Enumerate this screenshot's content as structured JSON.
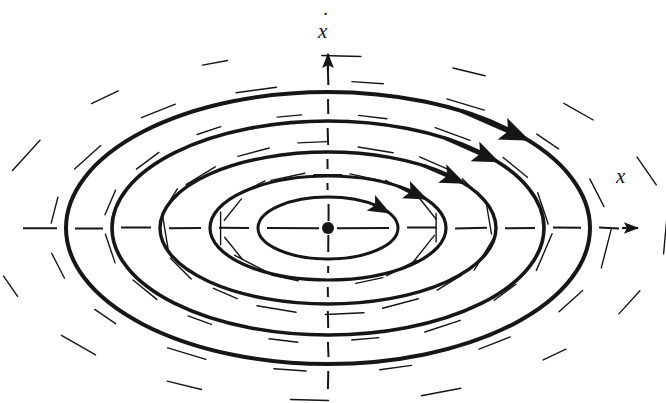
{
  "figure": {
    "kind": "phase-portrait",
    "caption_visible": false,
    "background_color": "#ffffff",
    "ink_color": "#161616",
    "axes": {
      "x_label": "x",
      "y_label": "ẋ",
      "y_label_base": "x",
      "y_label_dot": "˙",
      "x_axis_name": "horizontal-axis",
      "y_axis_name": "vertical-axis",
      "x_arrow_direction": "right",
      "y_arrow_direction": "up",
      "origin_px": [
        328,
        228
      ],
      "x_axis_extent_px": [
        14,
        640
      ],
      "y_axis_extent_px": [
        56,
        396
      ],
      "style": "dashed-segmented"
    },
    "equilibrium": {
      "type": "center",
      "marker": "filled-dot",
      "position_px": [
        328,
        228
      ],
      "radius_px": 6
    },
    "flow_direction": "clockwise",
    "arrow_count": 5,
    "trajectory_count": 5
  },
  "chart_data": {
    "type": "scatter",
    "title": "",
    "subtitle": "",
    "xlabel": "x",
    "ylabel": "ẋ",
    "grid": false,
    "legend": "none",
    "xlim": [
      -314,
      312
    ],
    "ylim": [
      -172,
      172
    ],
    "center_px": [
      328,
      228
    ],
    "orbits": [
      {
        "name": "orbit-1-inner",
        "semi_axis_x": 70,
        "semi_axis_y": 31,
        "stroke_width": 3.0,
        "arrow_angle_deg": 40
      },
      {
        "name": "orbit-2",
        "semi_axis_x": 118,
        "semi_axis_y": 52,
        "stroke_width": 3.2,
        "arrow_angle_deg": 44
      },
      {
        "name": "orbit-3",
        "semi_axis_x": 168,
        "semi_axis_y": 76,
        "stroke_width": 3.4,
        "arrow_angle_deg": 46
      },
      {
        "name": "orbit-4",
        "semi_axis_x": 216,
        "semi_axis_y": 107,
        "stroke_width": 3.6,
        "arrow_angle_deg": 48
      },
      {
        "name": "orbit-5-outer",
        "semi_axis_x": 262,
        "semi_axis_y": 136,
        "stroke_width": 4.0,
        "arrow_angle_deg": 50
      }
    ],
    "direction_field": {
      "description": "short line segments tangent to the clockwise elliptical flow",
      "segment_length_px": 34,
      "ring_radii_fraction": [
        0.4,
        0.62,
        0.84,
        1.06,
        1.28
      ],
      "segments_per_ring": 16,
      "stroke_width": 1.4
    },
    "axis_ticks_x_px": [
      -314,
      -262,
      -216,
      -168,
      -118,
      -70,
      70,
      118,
      168,
      216,
      262,
      300
    ],
    "axis_ticks_y_px": [
      -136,
      -107,
      -76,
      -52,
      -31,
      31,
      52,
      76,
      107,
      136
    ]
  }
}
